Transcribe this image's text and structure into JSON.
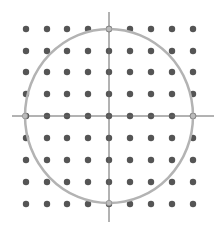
{
  "diagram": {
    "grid": {
      "cols": 9,
      "rows": 9,
      "x_positions": [
        26,
        47,
        67,
        88,
        109,
        130,
        151,
        172,
        193
      ],
      "y_positions": [
        29,
        51,
        72,
        94,
        116,
        138,
        160,
        182,
        204
      ],
      "dot_radius": 3.2,
      "dot_color": "#555555"
    },
    "axes": {
      "color": "#666666",
      "horizontal": {
        "x1": 12,
        "x2": 214,
        "y": 116
      },
      "vertical": {
        "x": 109,
        "y1": 12,
        "y2": 222
      }
    },
    "circle": {
      "cx": 109,
      "cy": 116,
      "rx": 84,
      "ry": 87,
      "stroke": "#b3b3b3",
      "stroke_width": 2.5
    },
    "intersection_marker_color": "#bbbbbb"
  }
}
